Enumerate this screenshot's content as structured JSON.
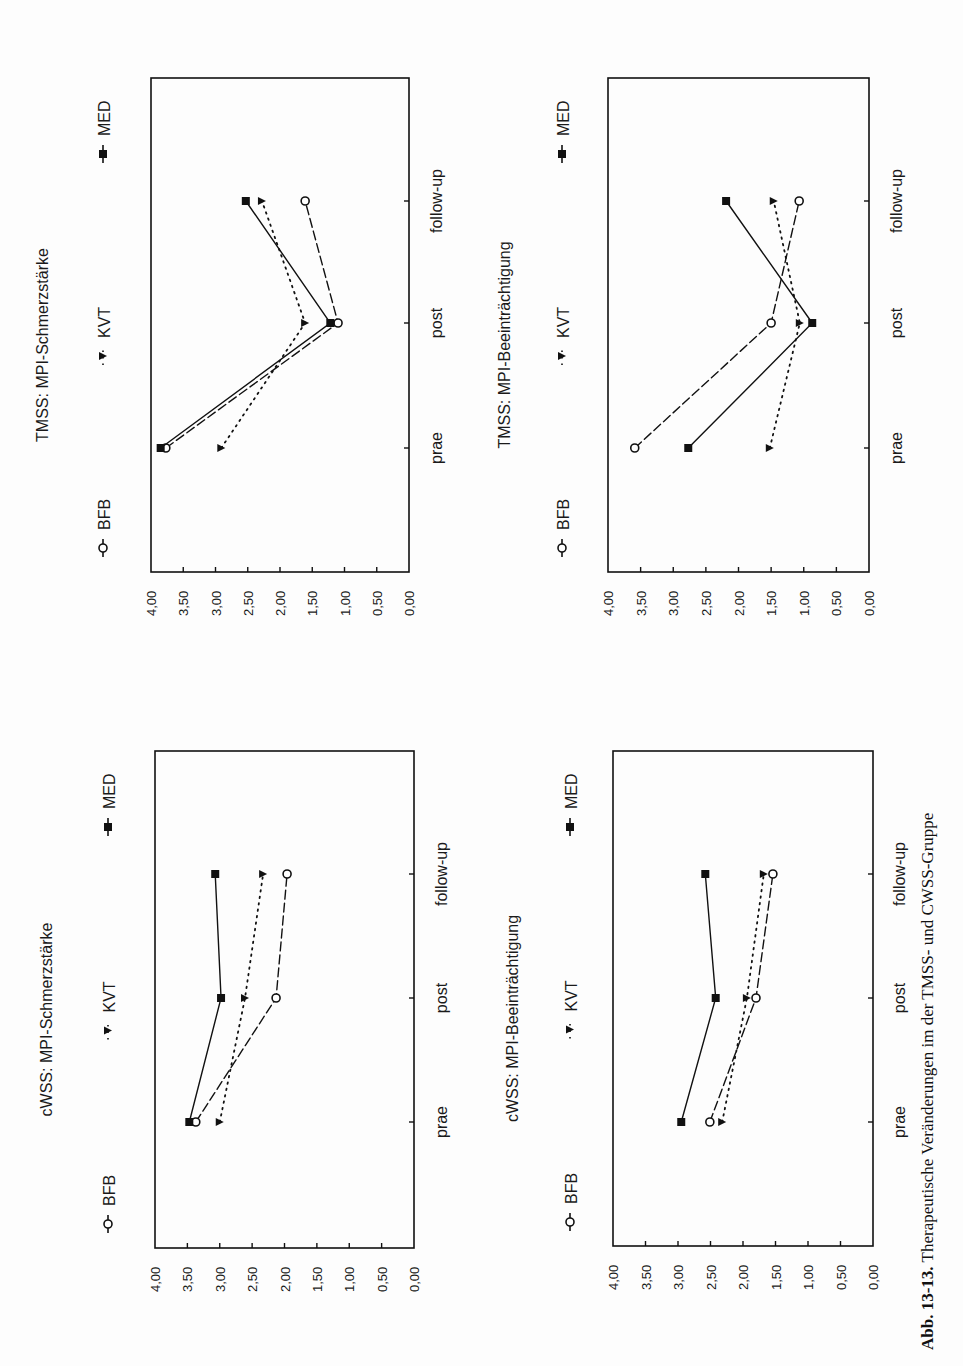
{
  "caption": {
    "label": "Abb. 13-13.",
    "text": "Therapeutische Veränderungen im der TMSS- und CWSS-Gruppe"
  },
  "legend": {
    "items": [
      {
        "name": "BFB",
        "marker": "open-circle",
        "line": "dashed"
      },
      {
        "name": "KVT",
        "marker": "filled-triangle",
        "line": "dotted"
      },
      {
        "name": "MED",
        "marker": "filled-square",
        "line": "solid"
      }
    ]
  },
  "axis": {
    "ticks": [
      "4,00",
      "3,50",
      "3,00",
      "2,50",
      "2,00",
      "1,50",
      "1,00",
      "0,50",
      "0,00"
    ],
    "categories": [
      "prae",
      "post",
      "follow-up"
    ]
  },
  "chart_data": [
    {
      "type": "line",
      "title": "TMSS: MPI-Schmerzstärke",
      "categories": [
        "prae",
        "post",
        "follow-up"
      ],
      "series": [
        {
          "name": "BFB",
          "values": [
            3.77,
            1.1,
            1.61
          ]
        },
        {
          "name": "KVT",
          "values": [
            2.91,
            1.61,
            2.28
          ]
        },
        {
          "name": "MED",
          "values": [
            3.85,
            1.22,
            2.53
          ]
        }
      ],
      "xlabel": "",
      "ylabel": "",
      "ylim": [
        0,
        4
      ],
      "yticks": [
        "0,00",
        "0,50",
        "1,00",
        "1,50",
        "2,00",
        "2,50",
        "3,00",
        "3,50",
        "4,00"
      ],
      "grid": false,
      "legend_position": "top",
      "orientation": "rotated -90deg on page"
    },
    {
      "type": "line",
      "title": "TMSS: MPI-Beeinträchtigung",
      "categories": [
        "prae",
        "post",
        "follow-up"
      ],
      "series": [
        {
          "name": "BFB",
          "values": [
            3.59,
            1.5,
            1.07
          ]
        },
        {
          "name": "KVT",
          "values": [
            1.52,
            1.06,
            1.46
          ]
        },
        {
          "name": "MED",
          "values": [
            2.77,
            0.87,
            2.19
          ]
        }
      ],
      "xlabel": "",
      "ylabel": "",
      "ylim": [
        0,
        4
      ],
      "yticks": [
        "0,00",
        "0,50",
        "1,00",
        "1,50",
        "2,00",
        "2,50",
        "3,00",
        "3,50",
        "4,00"
      ],
      "grid": false,
      "legend_position": "top",
      "orientation": "rotated -90deg on page"
    },
    {
      "type": "line",
      "title": "cWSS: MPI-Schmerzstärke",
      "categories": [
        "prae",
        "post",
        "follow-up"
      ],
      "series": [
        {
          "name": "BFB",
          "values": [
            3.37,
            2.13,
            1.96
          ]
        },
        {
          "name": "KVT",
          "values": [
            3.0,
            2.61,
            2.33
          ]
        },
        {
          "name": "MED",
          "values": [
            3.47,
            2.98,
            3.07
          ]
        }
      ],
      "xlabel": "",
      "ylabel": "",
      "ylim": [
        0,
        4
      ],
      "yticks": [
        "0,00",
        "0,50",
        "1,00",
        "1,50",
        "2,00",
        "2,50",
        "3,00",
        "3,50",
        "4,00"
      ],
      "grid": false,
      "legend_position": "top",
      "orientation": "rotated -90deg on page"
    },
    {
      "type": "line",
      "title": "cWSS: MPI-Beeinträchtigung",
      "categories": [
        "prae",
        "post",
        "follow-up"
      ],
      "series": [
        {
          "name": "BFB",
          "values": [
            2.51,
            1.8,
            1.54
          ]
        },
        {
          "name": "KVT",
          "values": [
            2.32,
            1.94,
            1.68
          ]
        },
        {
          "name": "MED",
          "values": [
            2.95,
            2.42,
            2.58
          ]
        }
      ],
      "xlabel": "",
      "ylabel": "",
      "ylim": [
        0,
        4
      ],
      "yticks": [
        "0,00",
        "0,50",
        "1,00",
        "1,50",
        "2,00",
        "2,50",
        "3,00",
        "3,50",
        "4,00"
      ],
      "grid": false,
      "legend_position": "top",
      "orientation": "rotated -90deg on page"
    }
  ],
  "panels": [
    {
      "title": "TMSS: MPI-Schmerzstärke",
      "box": {
        "x0": 151,
        "x1": 409,
        "y0": 78,
        "y1": 572
      },
      "title_x": 48,
      "legend_x": 103,
      "cat_x": 430,
      "tick_x": 440,
      "cat_y": [
        448,
        323,
        201
      ]
    },
    {
      "title": "TMSS: MPI-Beeinträchtigung",
      "box": {
        "x0": 608,
        "x1": 869,
        "y0": 78,
        "y1": 572
      },
      "title_x": 510,
      "legend_x": 562,
      "cat_x": 890,
      "tick_x": 900,
      "cat_y": [
        448,
        323,
        201
      ]
    },
    {
      "title": "cWSS: MPI-Schmerzstärke",
      "box": {
        "x0": 155,
        "x1": 414,
        "y0": 751,
        "y1": 1248
      },
      "title_x": 52,
      "legend_x": 108,
      "cat_x": 435,
      "tick_x": 445,
      "cat_y": [
        1122,
        998,
        874
      ]
    },
    {
      "title": "cWSS: MPI-Beeinträchtigung",
      "box": {
        "x0": 613,
        "x1": 873,
        "y0": 751,
        "y1": 1246
      },
      "title_x": 518,
      "legend_x": 570,
      "cat_x": 893,
      "tick_x": 903,
      "cat_y": [
        1122,
        998,
        874
      ]
    }
  ]
}
